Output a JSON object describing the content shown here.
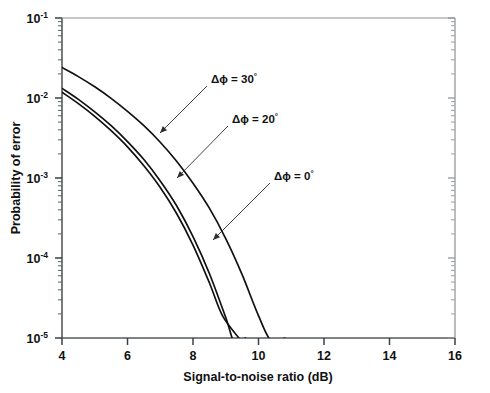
{
  "chart_data": {
    "type": "line",
    "title": "",
    "xlabel": "Signal-to-noise ratio (dB)",
    "ylabel": "Probability of error",
    "xscale": "linear",
    "yscale": "log",
    "xlim": [
      4,
      16
    ],
    "ylim": [
      1e-05,
      0.1
    ],
    "xticks": [
      4,
      6,
      8,
      10,
      12,
      14,
      16
    ],
    "xticklabels": [
      "4",
      "6",
      "8",
      "10",
      "12",
      "14",
      "16"
    ],
    "yticks": [
      0.1,
      0.01,
      0.001,
      0.0001,
      1e-05
    ],
    "yticklabels": [
      "10-1",
      "10-2",
      "10-3",
      "10-4",
      "10-5"
    ],
    "ytick_bases": [
      "10",
      "10",
      "10",
      "10",
      "10"
    ],
    "ytick_exponents": [
      "-1",
      "-2",
      "-3",
      "-4",
      "-5"
    ],
    "grid": false,
    "legend": "annotations",
    "minor_ticks": true,
    "series": [
      {
        "name": "dphi-30",
        "label": "Δϕ = 30°",
        "color": "#111111",
        "x": [
          4.0,
          4.5,
          5.0,
          5.5,
          6.0,
          6.5,
          7.0,
          7.5,
          8.0,
          8.5,
          9.0,
          9.5,
          10.0,
          10.4,
          10.8
        ],
        "y": [
          0.024,
          0.0185,
          0.0138,
          0.0099,
          0.0068,
          0.0045,
          0.0028,
          0.00162,
          0.00086,
          0.00042,
          0.000175,
          6.2e-05,
          1.9e-05,
          9e-06,
          1e-05
        ]
      },
      {
        "name": "dphi-20",
        "label": "Δϕ = 20°",
        "color": "#111111",
        "x": [
          4.0,
          4.5,
          5.0,
          5.5,
          6.0,
          6.5,
          7.0,
          7.5,
          8.0,
          8.5,
          9.0,
          9.3,
          9.6
        ],
        "y": [
          0.0132,
          0.0096,
          0.0067,
          0.0045,
          0.00285,
          0.0017,
          0.00092,
          0.00045,
          0.000185,
          6.4e-05,
          1.8e-05,
          8e-06,
          1e-05
        ]
      },
      {
        "name": "dphi-0",
        "label": "Δϕ = 0°",
        "color": "#111111",
        "x": [
          4.0,
          4.5,
          5.0,
          5.5,
          6.0,
          6.5,
          7.0,
          7.5,
          8.0,
          8.5,
          8.9,
          9.4
        ],
        "y": [
          0.0118,
          0.0085,
          0.0059,
          0.0039,
          0.00245,
          0.00142,
          0.00076,
          0.00036,
          0.000145,
          4.9e-05,
          1.9e-05,
          1e-05
        ]
      }
    ],
    "annotations": [
      {
        "name": "annotation-dphi-30",
        "text": "Δϕ = 30°",
        "delta": "Δϕ",
        "equals": " = ",
        "value": "30",
        "degree": "°",
        "label_x": 211,
        "label_y": 83,
        "leader_from_x": 207,
        "leader_from_y": 86,
        "leader_to_x": 160,
        "leader_to_y": 133
      },
      {
        "name": "annotation-dphi-20",
        "text": "Δϕ = 20°",
        "delta": "Δϕ",
        "equals": " = ",
        "value": "20",
        "degree": "°",
        "label_x": 232,
        "label_y": 123,
        "leader_from_x": 228,
        "leader_from_y": 126,
        "leader_to_x": 177,
        "leader_to_y": 178
      },
      {
        "name": "annotation-dphi-0",
        "text": "Δϕ = 0°",
        "delta": "Δϕ",
        "equals": " = ",
        "value": "0",
        "degree": "°",
        "label_x": 274,
        "label_y": 180,
        "leader_from_x": 270,
        "leader_from_y": 183,
        "leader_to_x": 213,
        "leader_to_y": 240
      }
    ]
  },
  "axes": {
    "ylabel": "Probability of error",
    "xlabel": "Signal-to-noise ratio (dB)"
  }
}
